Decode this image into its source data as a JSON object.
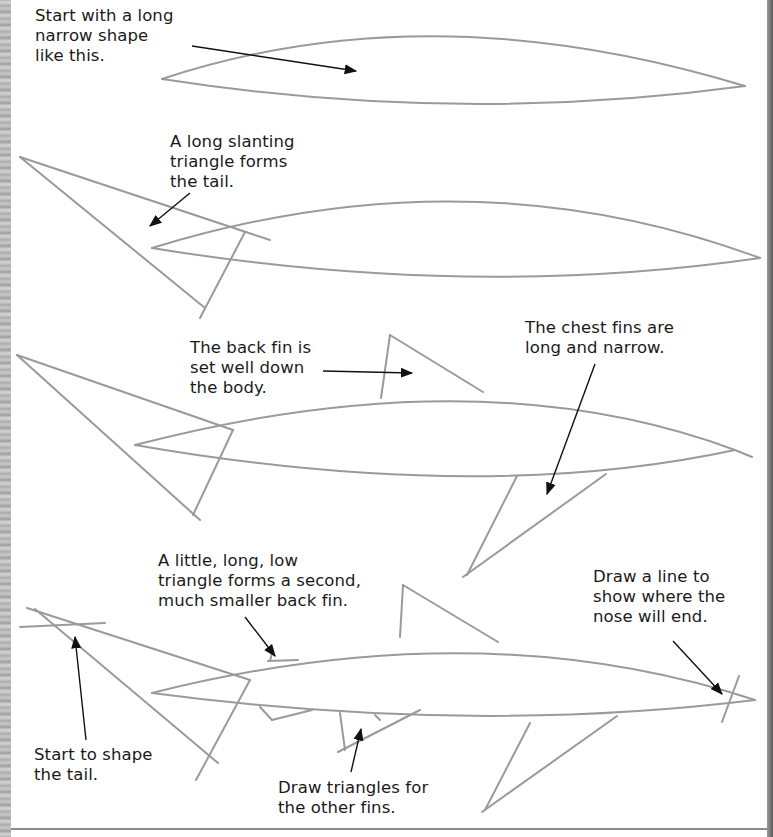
{
  "page": {
    "topic": "How to draw a shark – step by step",
    "accent_colors": {
      "pencil": "#9a9a9a",
      "ink": "#111111",
      "paper": "#ffffff"
    }
  },
  "steps": [
    {
      "id": 1,
      "captions": [
        {
          "text": "Start with a long\nnarrow shape\nlike this.",
          "x": 35,
          "y": 6
        }
      ]
    },
    {
      "id": 2,
      "captions": [
        {
          "text": "A long slanting\ntriangle forms\nthe tail.",
          "x": 170,
          "y": 132
        }
      ]
    },
    {
      "id": 3,
      "captions": [
        {
          "text": "The back fin is\nset well down\nthe body.",
          "x": 190,
          "y": 338
        },
        {
          "text": "The chest fins are\nlong and narrow.",
          "x": 525,
          "y": 318
        }
      ]
    },
    {
      "id": 4,
      "captions": [
        {
          "text": "A little, long, low\ntriangle forms a second,\nmuch smaller back fin.",
          "x": 158,
          "y": 551
        },
        {
          "text": "Draw a line to\nshow where the\nnose will end.",
          "x": 593,
          "y": 567
        },
        {
          "text": "Start to shape\nthe tail.",
          "x": 34,
          "y": 745
        },
        {
          "text": "Draw triangles for\nthe other fins.",
          "x": 278,
          "y": 778
        }
      ]
    }
  ]
}
